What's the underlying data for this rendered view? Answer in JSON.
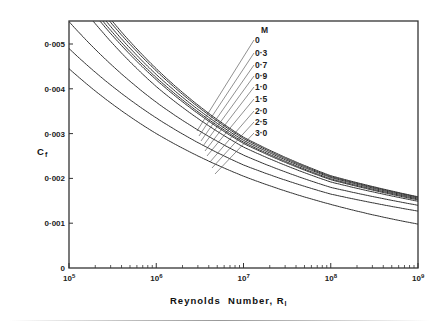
{
  "chart_data": {
    "type": "line",
    "title": "",
    "xlabel": "Reynolds  Number, R",
    "xlabel_subscript": "l",
    "ylabel": "C",
    "ylabel_subscript": "f",
    "xscale": "log",
    "xlim": [
      100000,
      1000000000
    ],
    "ylim": [
      0,
      0.0055
    ],
    "x_ticks": [
      {
        "value": 100000,
        "label": "10",
        "exp": "5"
      },
      {
        "value": 1000000,
        "label": "10",
        "exp": "6"
      },
      {
        "value": 10000000,
        "label": "10",
        "exp": "7"
      },
      {
        "value": 100000000,
        "label": "10",
        "exp": "8"
      },
      {
        "value": 1000000000,
        "label": "10",
        "exp": "9"
      }
    ],
    "y_ticks": [
      {
        "value": 0,
        "label": "0"
      },
      {
        "value": 0.001,
        "label": "0·001"
      },
      {
        "value": 0.002,
        "label": "0·002"
      },
      {
        "value": 0.003,
        "label": "0·003"
      },
      {
        "value": 0.004,
        "label": "0·004"
      },
      {
        "value": 0.005,
        "label": "0·005"
      }
    ],
    "grid": false,
    "legend_title": "M",
    "legend_position": "upper-middle, labels with leader lines",
    "x": [
      100000,
      1000000,
      10000000,
      100000000,
      1000000000
    ],
    "series": [
      {
        "name": "0",
        "values": [
          0.0068,
          0.00445,
          0.00292,
          0.00206,
          0.00159
        ]
      },
      {
        "name": "0·3",
        "values": [
          0.0067,
          0.0044,
          0.00289,
          0.00204,
          0.00158
        ]
      },
      {
        "name": "0·7",
        "values": [
          0.0066,
          0.00432,
          0.00285,
          0.00202,
          0.00156
        ]
      },
      {
        "name": "0·9",
        "values": [
          0.0065,
          0.00425,
          0.00281,
          0.00199,
          0.00154
        ]
      },
      {
        "name": "1·0",
        "values": [
          0.0064,
          0.0042,
          0.00278,
          0.00197,
          0.00152
        ]
      },
      {
        "name": "1·5",
        "values": [
          0.0062,
          0.00405,
          0.0027,
          0.00192,
          0.00149
        ]
      },
      {
        "name": "2·0",
        "values": [
          0.0055,
          0.0037,
          0.00252,
          0.0018,
          0.0014
        ]
      },
      {
        "name": "2·5",
        "values": [
          0.0049,
          0.00335,
          0.0023,
          0.00165,
          0.00127
        ]
      },
      {
        "name": "3·0",
        "values": [
          0.00445,
          0.003,
          0.00205,
          0.00142,
          0.00098
        ]
      }
    ]
  },
  "legend": {
    "title": "M",
    "labels": [
      "0",
      "0·3",
      "0·7",
      "0·9",
      "1·0",
      "1·5",
      "2·0",
      "2·5",
      "3·0"
    ]
  }
}
